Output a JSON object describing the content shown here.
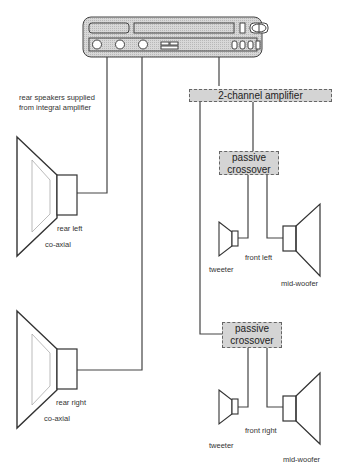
{
  "diagram": {
    "type": "car audio wiring diagram",
    "head_unit": {
      "name": "head unit"
    },
    "note": [
      "rear speakers supplied",
      "from integral amplifier"
    ],
    "amplifier": {
      "label": "2-channel amplifier"
    },
    "crossovers": [
      {
        "label_line1": "passive",
        "label_line2": "crossover"
      },
      {
        "label_line1": "passive",
        "label_line2": "crossover"
      }
    ],
    "rear_speakers": [
      {
        "position": "rear left",
        "type": "co-axial"
      },
      {
        "position": "rear right",
        "type": "co-axial"
      }
    ],
    "front_speakers": [
      {
        "position": "front left",
        "tweeter": "tweeter",
        "woofer": "mid-woofer"
      },
      {
        "position": "front right",
        "tweeter": "tweeter",
        "woofer": "mid-woofer"
      }
    ],
    "colors": {
      "line": "#333333",
      "fill": "#d4d4d4",
      "border": "#666666"
    }
  }
}
